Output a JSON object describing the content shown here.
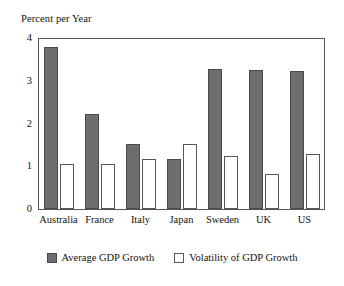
{
  "chart_data": {
    "type": "bar",
    "title": "",
    "xlabel": "",
    "ylabel": "Percent per Year",
    "ylim": [
      0,
      4
    ],
    "yticks": [
      0,
      1,
      2,
      3,
      4
    ],
    "ytick_labels": [
      "0",
      "1",
      "2",
      "3",
      "4"
    ],
    "grid": false,
    "legend_position": "bottom-center",
    "categories": [
      "Australia",
      "France",
      "Italy",
      "Japan",
      "Sweden",
      "UK",
      "US"
    ],
    "series": [
      {
        "name": "Average GDP Growth",
        "color": "#6e6e6e",
        "values": [
          3.8,
          2.22,
          1.53,
          1.18,
          3.28,
          3.26,
          3.22
        ]
      },
      {
        "name": "Volatility of GDP Growth",
        "color": "#ffffff",
        "values": [
          1.06,
          1.05,
          1.18,
          1.51,
          1.25,
          0.82,
          1.28
        ]
      }
    ]
  },
  "axes": {
    "y_axis_title": "Percent per Year"
  },
  "legend": {
    "items": [
      {
        "label": "Average GDP Growth",
        "swatch": "dark-gray-swatch"
      },
      {
        "label": "Volatility of GDP Growth",
        "swatch": "white-swatch"
      }
    ]
  },
  "colors": {
    "series_dark": "#6e6e6e",
    "series_dark_border": "#4a4a4a",
    "series_light": "#ffffff",
    "series_light_border": "#585858",
    "axis": "#555555",
    "background": "#ffffff",
    "text": "#111111"
  }
}
